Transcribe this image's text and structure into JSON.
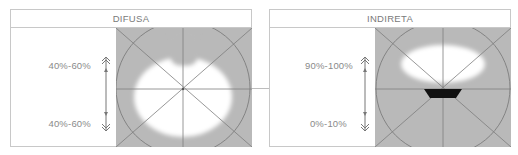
{
  "diagrams": [
    {
      "title": "DIFUSA",
      "upper_label": "40%-60%",
      "lower_label": "40%-60%",
      "light_pattern": "diffuse-blob-with-top-notch"
    },
    {
      "title": "INDIRETA",
      "upper_label": "90%-100%",
      "lower_label": "0%-10%",
      "light_pattern": "upward-ellipse-with-fixture"
    }
  ],
  "colors": {
    "panel_gray": "#b9b9b9",
    "light": "#ffffff",
    "lines": "#7d7d7d",
    "fixture": "#111111",
    "text": "#8a8a8a",
    "border": "#c8c8c8"
  }
}
